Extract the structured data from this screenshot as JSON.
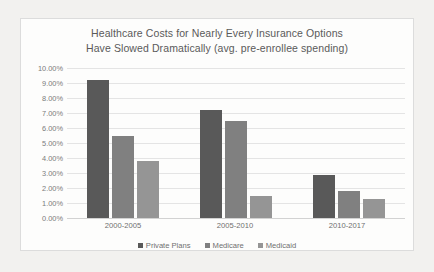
{
  "chart_data": {
    "type": "bar",
    "title": "Healthcare Costs for Nearly Every Insurance Options Have Slowed Dramatically (avg. pre-enrollee spending)",
    "title_lines": [
      "Healthcare Costs for Nearly Every Insurance Options",
      "Have Slowed Dramatically (avg. pre-enrollee spending)"
    ],
    "categories": [
      "2000-2005",
      "2005-2010",
      "2010-2017"
    ],
    "series": [
      {
        "name": "Private Plans",
        "values": [
          9.2,
          7.2,
          2.9
        ],
        "color": "#595959"
      },
      {
        "name": "Medicare",
        "values": [
          5.5,
          6.5,
          1.8
        ],
        "color": "#808080"
      },
      {
        "name": "Medicaid",
        "values": [
          3.8,
          1.5,
          1.3
        ],
        "color": "#959595"
      }
    ],
    "xlabel": "",
    "ylabel": "",
    "ylim": [
      0,
      10
    ],
    "ytick_values": [
      0,
      1,
      2,
      3,
      4,
      5,
      6,
      7,
      8,
      9,
      10
    ],
    "ytick_labels": [
      "0.00%",
      "1.00%",
      "2.00%",
      "3.00%",
      "4.00%",
      "5.00%",
      "6.00%",
      "7.00%",
      "8.00%",
      "9.00%",
      "10.00%"
    ],
    "grid": true,
    "legend_position": "bottom",
    "value_format": "percent"
  },
  "colors": {
    "page_background": "#f2f1ef",
    "chart_background": "#fdfdfc",
    "chart_border": "#dcdcdc",
    "gridline": "#e4e4e4",
    "title_text": "#5a5a5a",
    "tick_text": "#7b7b7b"
  }
}
